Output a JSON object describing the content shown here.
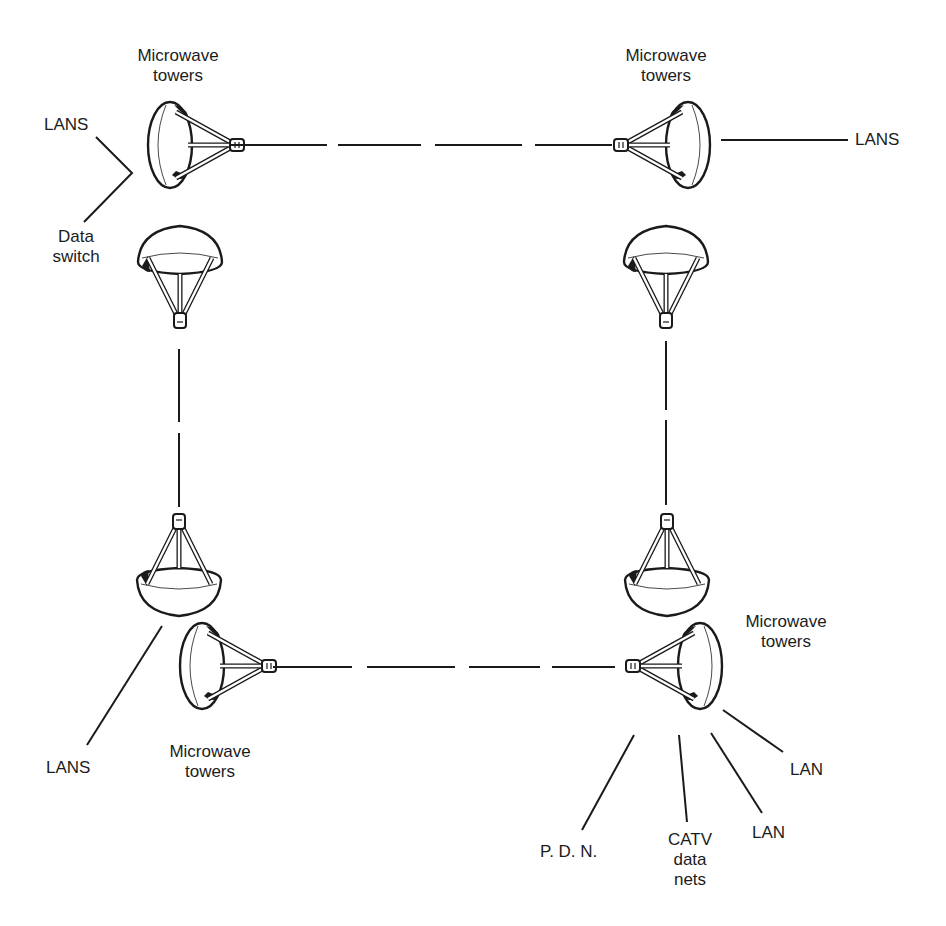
{
  "diagram": {
    "title": "",
    "colors": {
      "ink": "#1a1a1a",
      "background": "#ffffff",
      "dish_fill": "#ffffff"
    },
    "towers": {
      "top_left": {
        "label_line1": "Microwave",
        "label_line2": "towers",
        "dish_facing": "right"
      },
      "top_right": {
        "label_line1": "Microwave",
        "label_line2": "towers",
        "dish_facing": "left"
      },
      "bottom_left": {
        "label_line1": "Microwave",
        "label_line2": "towers",
        "dish_facing": "right"
      },
      "bottom_right": {
        "label_line1": "Microwave",
        "label_line2": "towers",
        "dish_facing": "left"
      }
    },
    "labels": {
      "lans_top_left": "LANS",
      "data_switch_line1": "Data",
      "data_switch_line2": "switch",
      "lans_top_right": "LANS",
      "lans_bottom_left": "LANS",
      "pdn": "P. D. N.",
      "catv_line1": "CATV",
      "catv_line2": "data",
      "catv_line3": "nets",
      "lan_lower": "LAN",
      "lan_upper": "LAN"
    },
    "links": [
      {
        "from": "top_left",
        "to": "top_right",
        "style": "dashed"
      },
      {
        "from": "top_left",
        "to": "bottom_left",
        "style": "dashed"
      },
      {
        "from": "top_right",
        "to": "bottom_right",
        "style": "dashed"
      },
      {
        "from": "bottom_left",
        "to": "bottom_right",
        "style": "dashed"
      }
    ]
  }
}
